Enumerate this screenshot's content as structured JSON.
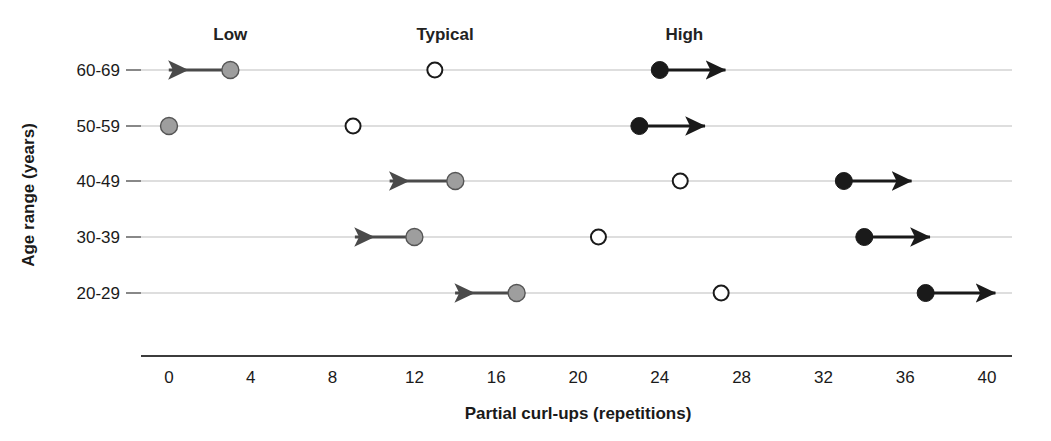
{
  "chart_data": {
    "type": "scatter",
    "title": "",
    "xlabel": "Partial curl-ups (repetitions)",
    "ylabel": "Age range (years)",
    "xlim": [
      0,
      40
    ],
    "xticks": [
      0,
      4,
      8,
      12,
      16,
      20,
      24,
      28,
      32,
      36,
      40
    ],
    "xtick_labels": [
      "0",
      "4",
      "8",
      "12",
      "16",
      "20",
      "24",
      "28",
      "32",
      "36",
      "40"
    ],
    "grid": false,
    "categories": [
      "60-69",
      "50-59",
      "40-49",
      "30-39",
      "20-29"
    ],
    "legend_position": "top",
    "column_headers": [
      {
        "label": "Low",
        "x": 3
      },
      {
        "label": "Typical",
        "x": 13.5
      },
      {
        "label": "High",
        "x": 25.2
      }
    ],
    "series": [
      {
        "name": "Low",
        "marker": "filled-gray-circle",
        "color": "#9e9e9e",
        "values": [
          3,
          0,
          14,
          12,
          17
        ],
        "arrow_direction": "left",
        "arrow_tips": [
          -0.5,
          null,
          10.3,
          8.6,
          13.5
        ]
      },
      {
        "name": "Typical",
        "marker": "open-circle",
        "color": "#ffffff",
        "values": [
          13,
          9,
          25,
          21,
          27
        ],
        "arrow_direction": "none",
        "arrow_tips": [
          null,
          null,
          null,
          null,
          null
        ]
      },
      {
        "name": "High",
        "marker": "filled-black-circle",
        "color": "#1a1a1a",
        "values": [
          24,
          23,
          33,
          34,
          37
        ],
        "arrow_direction": "right",
        "arrow_tips": [
          27.7,
          26.7,
          36.8,
          37.7,
          40.9
        ]
      }
    ],
    "rows": [
      {
        "category": "60-69",
        "low": 3,
        "low_arrow_to": -0.5,
        "typical": 13,
        "high": 24,
        "high_arrow_to": 27.7
      },
      {
        "category": "50-59",
        "low": 0,
        "low_arrow_to": null,
        "typical": 9,
        "high": 23,
        "high_arrow_to": 26.7
      },
      {
        "category": "40-49",
        "low": 14,
        "low_arrow_to": 10.3,
        "typical": 25,
        "high": 33,
        "high_arrow_to": 36.8
      },
      {
        "category": "30-39",
        "low": 12,
        "low_arrow_to": 8.6,
        "typical": 21,
        "high": 34,
        "high_arrow_to": 37.7
      },
      {
        "category": "20-29",
        "low": 17,
        "low_arrow_to": 13.5,
        "typical": 27,
        "high": 37,
        "high_arrow_to": 40.9
      }
    ],
    "colors": {
      "low_marker": "#9e9e9e",
      "typical_marker": "#ffffff",
      "high_marker": "#1a1a1a",
      "baseline": "#bdbdbd",
      "axis": "#3c3c3c",
      "text": "#1a1a1a",
      "background": "#ffffff"
    }
  }
}
